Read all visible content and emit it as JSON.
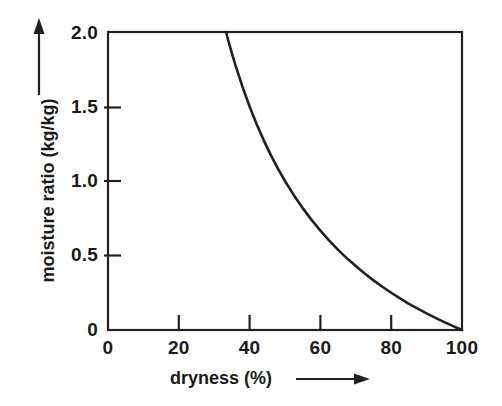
{
  "chart_data": {
    "type": "line",
    "title": "",
    "subtitle": "",
    "xlabel": "dryness (%)",
    "ylabel": "moisture ratio (kg/kg)",
    "xlim": [
      0,
      100
    ],
    "ylim": [
      0,
      2.0
    ],
    "grid": false,
    "legend": null,
    "x_ticks": [
      0,
      20,
      40,
      60,
      80,
      100
    ],
    "x_tick_labels": [
      "0",
      "20",
      "40",
      "60",
      "80",
      "100"
    ],
    "y_ticks": [
      0,
      0.5,
      1.0,
      1.5,
      2.0
    ],
    "y_tick_labels": [
      "0",
      "0.5",
      "1.0",
      "1.5",
      "2.0"
    ],
    "relation": "moisture ratio = (100 - dryness) / dryness",
    "series": [
      {
        "name": "moisture ratio",
        "color": "#231f20",
        "x": [
          33.34,
          34,
          35,
          36,
          38,
          40,
          42,
          44,
          46,
          48,
          50,
          52.5,
          55,
          57.5,
          60,
          62.5,
          65,
          67.5,
          70,
          72.5,
          75,
          77.5,
          80,
          82.5,
          85,
          87.5,
          90,
          92.5,
          95,
          97.5,
          100
        ],
        "values": [
          2.0,
          1.941,
          1.857,
          1.778,
          1.632,
          1.5,
          1.381,
          1.273,
          1.174,
          1.083,
          1.0,
          0.905,
          0.818,
          0.739,
          0.667,
          0.6,
          0.538,
          0.481,
          0.429,
          0.379,
          0.333,
          0.29,
          0.25,
          0.212,
          0.176,
          0.143,
          0.111,
          0.081,
          0.053,
          0.026,
          0.0
        ]
      }
    ],
    "annotations": [
      {
        "name": "y-axis-direction-arrow",
        "symbol": "arrow-up"
      },
      {
        "name": "x-axis-direction-arrow",
        "symbol": "arrow-right"
      }
    ]
  },
  "axes": {
    "y_title": "moisture ratio (kg/kg)",
    "x_title": "dryness (%)"
  },
  "ticks": {
    "y": [
      {
        "label": "2.0",
        "value": 2.0
      },
      {
        "label": "1.5",
        "value": 1.5
      },
      {
        "label": "1.0",
        "value": 1.0
      },
      {
        "label": "0.5",
        "value": 0.5
      },
      {
        "label": "0",
        "value": 0
      }
    ],
    "x": [
      {
        "label": "0",
        "value": 0
      },
      {
        "label": "20",
        "value": 20
      },
      {
        "label": "40",
        "value": 40
      },
      {
        "label": "60",
        "value": 60
      },
      {
        "label": "80",
        "value": 80
      },
      {
        "label": "100",
        "value": 100
      }
    ]
  },
  "colors": {
    "curve": "#231f20",
    "frame": "#231f20",
    "background": "#ffffff",
    "text": "#1a1a1a"
  }
}
